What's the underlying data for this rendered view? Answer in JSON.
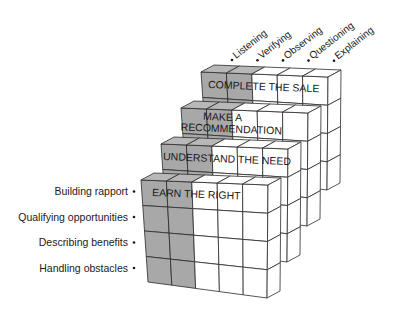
{
  "diagram": {
    "type": "layered-cube-matrix",
    "colors": {
      "shaded": "#a8a8a8",
      "shaded_top": "#b8b8b8",
      "face": "#ffffff",
      "line": "#2a2a2a",
      "text": "#1a1a1a"
    },
    "layers": [
      {
        "title_lines": [
          "COMPLETE THE SALE"
        ]
      },
      {
        "title_lines": [
          "MAKE A",
          "RECOMMENDATION"
        ]
      },
      {
        "title_lines": [
          "UNDERSTAND THE NEED"
        ]
      },
      {
        "title_lines": [
          "EARN THE RIGHT"
        ]
      }
    ],
    "column_labels": [
      "Listening",
      "Verifying",
      "Observing",
      "Questioning",
      "Explaining"
    ],
    "row_labels": [
      "Building rapport",
      "Qualifying opportunities",
      "Describing benefits",
      "Handling obstacles"
    ],
    "shaded_columns": 2,
    "grid": {
      "columns": 5,
      "rows": 4
    }
  }
}
